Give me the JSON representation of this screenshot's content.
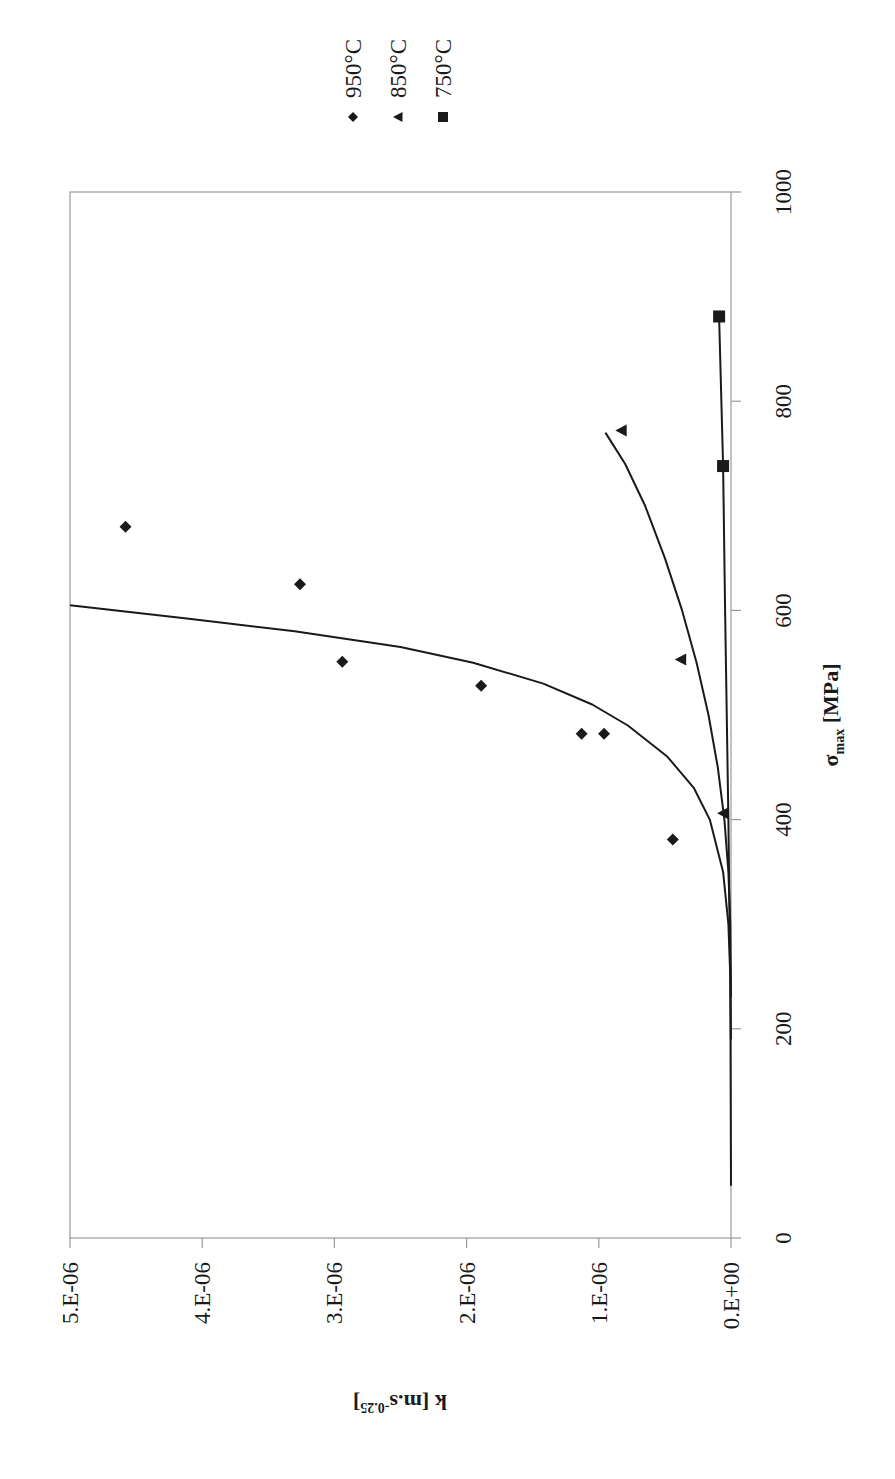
{
  "chart_data": {
    "type": "scatter",
    "orientation_note_visible": "rotated 90 degrees clockwise on page",
    "title": "",
    "xlabel": "σmax [MPa]",
    "xlabel_main": "σ",
    "xlabel_sub": "max",
    "xlabel_unit": " [MPa]",
    "ylabel": "k [m.s-0.25]",
    "ylabel_main": "k [m.s",
    "ylabel_sup": "-0.25",
    "ylabel_end": "]",
    "xlim": [
      0,
      1000
    ],
    "ylim": [
      0,
      5e-06
    ],
    "x_ticks": [
      0,
      200,
      400,
      600,
      800,
      1000
    ],
    "x_tick_labels": [
      "0",
      "200",
      "400",
      "600",
      "800",
      "1000"
    ],
    "y_ticks": [
      0,
      1e-06,
      2e-06,
      3e-06,
      4e-06,
      5e-06
    ],
    "y_tick_labels": [
      "0.E+00",
      "1.E-06",
      "2.E-06",
      "3.E-06",
      "4.E-06",
      "5.E-06"
    ],
    "grid": false,
    "legend_position": "outside, beyond high-stress end of axis",
    "series": [
      {
        "name": "950°C",
        "marker": "diamond",
        "points": [
          {
            "x": 381,
            "y": 4.4e-07
          },
          {
            "x": 482,
            "y": 9.6e-07
          },
          {
            "x": 482,
            "y": 1.13e-06
          },
          {
            "x": 528,
            "y": 1.89e-06
          },
          {
            "x": 551,
            "y": 2.94e-06
          },
          {
            "x": 625,
            "y": 3.26e-06
          },
          {
            "x": 680,
            "y": 4.58e-06
          }
        ],
        "fit_curve": [
          [
            50,
            0
          ],
          [
            250,
            5e-09
          ],
          [
            300,
            2e-08
          ],
          [
            350,
            6e-08
          ],
          [
            400,
            1.6e-07
          ],
          [
            430,
            2.8e-07
          ],
          [
            460,
            4.8e-07
          ],
          [
            490,
            7.8e-07
          ],
          [
            510,
            1.05e-06
          ],
          [
            530,
            1.42e-06
          ],
          [
            550,
            1.95e-06
          ],
          [
            565,
            2.5e-06
          ],
          [
            580,
            3.3e-06
          ],
          [
            592,
            4.1e-06
          ],
          [
            605,
            5e-06
          ]
        ]
      },
      {
        "name": "850°C",
        "marker": "triangle",
        "points": [
          {
            "x": 406,
            "y": 6e-08
          },
          {
            "x": 553,
            "y": 3.8e-07
          },
          {
            "x": 772,
            "y": 8.3e-07
          }
        ],
        "fit_curve": [
          [
            230,
            0
          ],
          [
            300,
            5e-09
          ],
          [
            350,
            2e-08
          ],
          [
            400,
            5e-08
          ],
          [
            450,
            1e-07
          ],
          [
            500,
            1.7e-07
          ],
          [
            550,
            2.6e-07
          ],
          [
            600,
            3.7e-07
          ],
          [
            650,
            5e-07
          ],
          [
            700,
            6.5e-07
          ],
          [
            740,
            8e-07
          ],
          [
            770,
            9.5e-07
          ]
        ]
      },
      {
        "name": "750°C",
        "marker": "square",
        "points": [
          {
            "x": 738,
            "y": 6e-08
          },
          {
            "x": 881,
            "y": 9e-08
          }
        ],
        "fit_curve": [
          [
            190,
            0
          ],
          [
            400,
            2e-08
          ],
          [
            600,
            4.5e-08
          ],
          [
            738,
            6e-08
          ],
          [
            881,
            9e-08
          ]
        ]
      }
    ]
  },
  "legend": {
    "items": [
      {
        "label": "950°C",
        "marker": "diamond"
      },
      {
        "label": "850°C",
        "marker": "triangle"
      },
      {
        "label": "750°C",
        "marker": "square"
      }
    ]
  },
  "colors": {
    "ink": "#1a1a1a",
    "frame": "#9a9a9a",
    "background": "#ffffff"
  }
}
